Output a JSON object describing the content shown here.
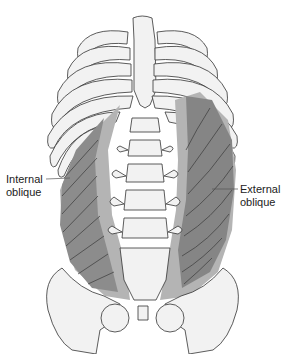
{
  "diagram": {
    "labels": {
      "internal_oblique": {
        "line1": "Internal",
        "line2": "oblique"
      },
      "external_oblique": {
        "line1": "External",
        "line2": "oblique"
      }
    },
    "colors": {
      "bone_fill": "#f2f2f2",
      "bone_outline": "#333333",
      "internal_oblique_fill": "#8c8c8c",
      "external_oblique_fill": "#858585",
      "aponeurosis_fill": "#b4b4b4",
      "fiber_lines": "#3a3a3a",
      "leader_line": "#555555"
    }
  }
}
